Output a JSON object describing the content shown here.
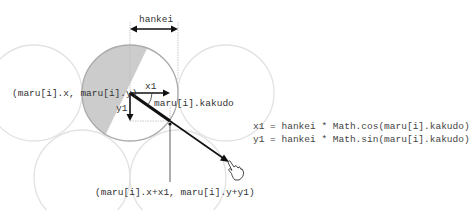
{
  "labels": {
    "hankei": "hankei",
    "center": "(maru[i].x, maru[i].y)",
    "x1": "x1",
    "y1": "y1",
    "kakudo": "maru[i].kakudo",
    "edge_point": "(maru[i].x+x1, maru[i].y+y1)"
  },
  "formulas": [
    "x1 = hankei * Math.cos(maru[i].kakudo)",
    "y1 = hankei * Math.sin(maru[i].kakudo)"
  ],
  "icons": {
    "cursor": "pointing-hand-cursor-icon"
  },
  "colors": {
    "main_circle": "#aaaaaa",
    "shaded_region": "#cccccc",
    "background_circles": "#e2e2e2",
    "arrows": "#111111",
    "guide_lines": "#bbbbbb"
  }
}
